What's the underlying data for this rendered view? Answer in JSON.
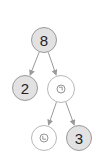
{
  "diagram": {
    "type": "binary-tree",
    "colors": {
      "filled_node": "#e2e2e2",
      "filled_border": "#9a9a9a",
      "empty_node": "#ffffff",
      "empty_border": "#b8b8b8",
      "edge": "#9a9a9a",
      "text": "#222222"
    },
    "nodes": [
      {
        "id": "n0",
        "label": "8",
        "kind": "filled",
        "cx": 44,
        "cy": 40,
        "r": 13
      },
      {
        "id": "n1",
        "label": "2",
        "kind": "filled",
        "cx": 25,
        "cy": 88,
        "r": 13
      },
      {
        "id": "n2",
        "label": "",
        "kind": "empty",
        "icon": "clock-icon",
        "cx": 61,
        "cy": 89,
        "r": 14
      },
      {
        "id": "n3",
        "label": "",
        "kind": "empty",
        "icon": "clock-icon",
        "cx": 44,
        "cy": 138,
        "r": 13
      },
      {
        "id": "n4",
        "label": "3",
        "kind": "filled",
        "cx": 79,
        "cy": 138,
        "r": 13
      }
    ],
    "edges": [
      {
        "from": "n0",
        "to": "n1"
      },
      {
        "from": "n0",
        "to": "n2"
      },
      {
        "from": "n2",
        "to": "n3"
      },
      {
        "from": "n2",
        "to": "n4"
      }
    ]
  }
}
